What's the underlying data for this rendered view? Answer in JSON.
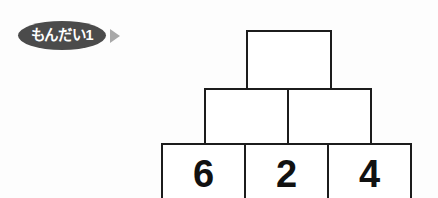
{
  "problem": {
    "badge_label": "もんだい1",
    "arrow_icon": "triangle-right-icon",
    "badge_color": "#4b4b4b",
    "arrow_color": "#a8a8a8"
  },
  "pyramid": {
    "type": "number-pyramid",
    "border_color": "#1c1c1c",
    "rows": [
      {
        "name": "top-row",
        "cells": [
          {
            "value": ""
          }
        ]
      },
      {
        "name": "middle-row",
        "cells": [
          {
            "value": ""
          },
          {
            "value": ""
          }
        ]
      },
      {
        "name": "bottom-row",
        "cells": [
          {
            "value": "6"
          },
          {
            "value": "2"
          },
          {
            "value": "4"
          }
        ]
      }
    ]
  }
}
